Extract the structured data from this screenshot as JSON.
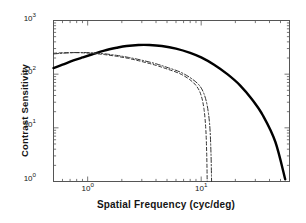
{
  "chart_data": {
    "type": "line",
    "title": "",
    "xlabel": "Spatial Frequency (cyc/deg)",
    "ylabel": "Contrast Sensitivity",
    "xscale": "log",
    "yscale": "log",
    "xlim": [
      0.5,
      60
    ],
    "ylim": [
      1,
      1000
    ],
    "xticks": [
      1,
      10
    ],
    "xticklabels": [
      "10⁰",
      "10¹"
    ],
    "yticks": [
      1,
      10,
      100,
      1000
    ],
    "yticklabels": [
      "10⁰",
      "10¹",
      "10²",
      "10³"
    ],
    "grid": false,
    "legend": null,
    "series": [
      {
        "name": "solid-curve",
        "style": "solid",
        "color": "#000000",
        "width": 2.4,
        "x": [
          0.5,
          0.6,
          0.75,
          0.9,
          1.1,
          1.4,
          1.8,
          2.2,
          2.8,
          3.5,
          4.5,
          6,
          8,
          10,
          13,
          17,
          22,
          28,
          35,
          45,
          55
        ],
        "y": [
          130,
          150,
          180,
          205,
          235,
          275,
          310,
          335,
          350,
          350,
          335,
          300,
          250,
          205,
          150,
          100,
          62,
          34,
          17,
          5.5,
          1.1
        ]
      },
      {
        "name": "dashed-curve",
        "style": "dashed",
        "color": "#333333",
        "width": 1.0,
        "x": [
          0.5,
          0.6,
          0.75,
          0.9,
          1.1,
          1.4,
          1.8,
          2.3,
          3,
          4,
          5,
          6.5,
          8,
          9.2,
          10,
          10.6,
          11,
          11.2,
          11.3
        ],
        "y": [
          245,
          250,
          252,
          250,
          244,
          232,
          215,
          196,
          172,
          146,
          125,
          102,
          78,
          58,
          40,
          22,
          9,
          3,
          1.0
        ]
      },
      {
        "name": "dash-dot-curve",
        "style": "dashdot",
        "color": "#333333",
        "width": 1.0,
        "x": [
          0.5,
          0.6,
          0.75,
          0.9,
          1.1,
          1.4,
          1.8,
          2.3,
          3,
          4,
          5,
          6.5,
          8,
          9.5,
          10.5,
          11.3,
          11.9,
          12.2,
          12.35
        ],
        "y": [
          238,
          246,
          252,
          253,
          250,
          240,
          224,
          205,
          182,
          156,
          134,
          110,
          86,
          64,
          45,
          26,
          11,
          3.4,
          1.0
        ]
      }
    ]
  },
  "axes": {
    "y_tick_0": "10",
    "y_tick_0_exp": "0",
    "y_tick_1": "10",
    "y_tick_1_exp": "1",
    "y_tick_2": "10",
    "y_tick_2_exp": "2",
    "y_tick_3": "10",
    "y_tick_3_exp": "3",
    "x_tick_0": "10",
    "x_tick_0_exp": "0",
    "x_tick_1": "10",
    "x_tick_1_exp": "1"
  },
  "labels": {
    "x_axis_title": "Spatial Frequency (cyc/deg)",
    "y_axis_title": "Contrast Sensitivity"
  }
}
